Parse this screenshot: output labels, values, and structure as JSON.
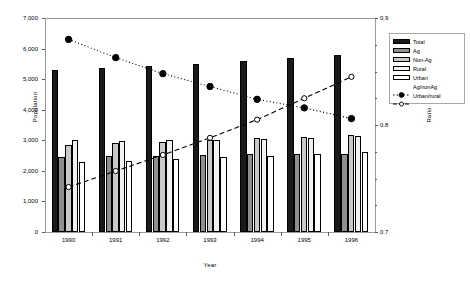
{
  "chart_data": {
    "type": "bar",
    "title": "",
    "xlabel": "Year",
    "ylabel": "Population",
    "ylabel_secondary": "Ratio",
    "categories": [
      "1990",
      "1991",
      "1992",
      "1993",
      "1994",
      "1995",
      "1996"
    ],
    "ylim": [
      0,
      7000
    ],
    "ylim_secondary": [
      0.7,
      0.9
    ],
    "ytick_labels": [
      "7,000",
      "6,000",
      "5,000",
      "4,000",
      "3,000",
      "2,000",
      "1,000",
      "0"
    ],
    "ytick_values": [
      7000,
      6000,
      5000,
      4000,
      3000,
      2000,
      1000,
      0
    ],
    "ytick_labels_secondary": [
      "0.9",
      "0.8",
      "0.7"
    ],
    "ytick_values_secondary": [
      0.9,
      0.8,
      0.7
    ],
    "grid": false,
    "legend_position": "right",
    "series": [
      {
        "name": "Total",
        "axis": "left",
        "kind": "bar",
        "color": "#1a1a1a",
        "values": [
          5300,
          5370,
          5440,
          5500,
          5600,
          5680,
          5780
        ]
      },
      {
        "name": "Ag",
        "axis": "left",
        "kind": "bar",
        "color": "#8f8f8f",
        "values": [
          2450,
          2480,
          2500,
          2520,
          2540,
          2550,
          2560
        ]
      },
      {
        "name": "Non-Ag",
        "axis": "left",
        "kind": "bar",
        "color": "#c9c9c9",
        "values": [
          2850,
          2900,
          2950,
          3020,
          3060,
          3110,
          3180
        ]
      },
      {
        "name": "Rural",
        "axis": "left",
        "kind": "bar",
        "color": "#f2f2f2",
        "values": [
          3020,
          2990,
          3000,
          3010,
          3050,
          3090,
          3150
        ]
      },
      {
        "name": "Urban",
        "axis": "left",
        "kind": "bar",
        "color": "#ffffff",
        "values": [
          2280,
          2330,
          2400,
          2460,
          2480,
          2540,
          2610
        ]
      },
      {
        "name": "Ag/nonAg",
        "axis": "right",
        "kind": "line",
        "style": "dotted",
        "marker": "filled-circle",
        "values": [
          0.88,
          0.863,
          0.848,
          0.836,
          0.824,
          0.816,
          0.806
        ]
      },
      {
        "name": "Urban/rural",
        "axis": "right",
        "kind": "line",
        "style": "dashed",
        "marker": "open-circle",
        "values": [
          0.742,
          0.757,
          0.772,
          0.788,
          0.805,
          0.825,
          0.845
        ]
      }
    ],
    "legend_entries": [
      {
        "label": "Total",
        "type": "swatch",
        "color": "#1a1a1a"
      },
      {
        "label": "Ag",
        "type": "swatch",
        "color": "#8f8f8f"
      },
      {
        "label": "Non-Ag",
        "type": "swatch",
        "color": "#c9c9c9"
      },
      {
        "label": "Rural",
        "type": "swatch",
        "color": "#f2f2f2"
      },
      {
        "label": "Urban",
        "type": "swatch",
        "color": "#ffffff"
      },
      {
        "label": "Ag/nonAg",
        "type": "line-dotted-filled"
      },
      {
        "label": "Urban/rural",
        "type": "line-dashed-open"
      }
    ]
  }
}
